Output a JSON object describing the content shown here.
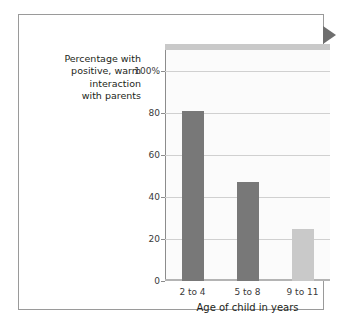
{
  "chart_data": {
    "type": "bar",
    "title": "",
    "categories": [
      "2 to 4",
      "5 to 8",
      "9 to 11"
    ],
    "values": [
      81,
      47,
      25
    ],
    "bar_colors": [
      "#787878",
      "#787878",
      "#c9c9c9"
    ],
    "xlabel": "Age of child in years",
    "ylabel": "Percentage with positive, warm interaction with parents",
    "ylabel_lines": [
      "Percentage with",
      "positive, warm",
      "interaction",
      "with parents"
    ],
    "ylim": [
      0,
      110
    ],
    "yticks": [
      0,
      20,
      40,
      60,
      80,
      100
    ],
    "ytick_labels": [
      "0",
      "20",
      "40",
      "60",
      "80",
      "100%"
    ],
    "grid": true,
    "legend": "none",
    "plot_background": "#fbfbfb",
    "gridline_color": "#d0d0d0",
    "axis_color": "#8c8c8c"
  },
  "frame": {
    "border_color": "#9a9a9a",
    "marker_color": "#6e6e6e",
    "marker_icon": "triangle-right-icon"
  }
}
